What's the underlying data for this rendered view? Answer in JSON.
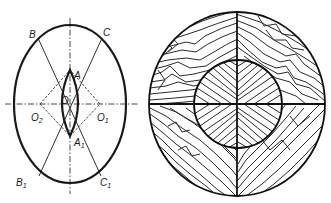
{
  "figure": {
    "left_panel": {
      "description": "Construction of an oval from four arcs",
      "points": {
        "B": {
          "label": "B",
          "x": 29,
          "y": 38
        },
        "C": {
          "label": "C",
          "x": 105,
          "y": 36
        },
        "A": {
          "label": "A",
          "x": 74,
          "y": 75
        },
        "O": {
          "label": "O",
          "x": 63,
          "y": 102
        },
        "O2": {
          "label": "O",
          "sub": "2",
          "x": 30,
          "y": 119
        },
        "O1": {
          "label": "O",
          "sub": "1",
          "x": 97,
          "y": 119
        },
        "A1": {
          "label": "A",
          "sub": "1",
          "x": 74,
          "y": 145
        },
        "B1": {
          "label": "B",
          "sub": "1",
          "x": 16,
          "y": 186
        },
        "C1": {
          "label": "C",
          "sub": "1",
          "x": 101,
          "y": 186
        }
      }
    },
    "right_panel": {
      "description": "Cross section of a circular wooden element with wood grain hatching, divided into quadrants with inner circle"
    }
  },
  "colors": {
    "ink": "#1a1a1a",
    "background": "#ffffff"
  }
}
